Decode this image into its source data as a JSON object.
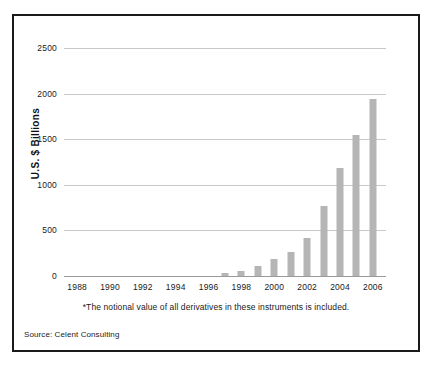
{
  "chart_data": {
    "type": "bar",
    "title": "",
    "xlabel": "",
    "ylabel": "U.S. $ Billions",
    "ylim": [
      0,
      2500
    ],
    "yticks": [
      0,
      500,
      1000,
      1500,
      2000,
      2500
    ],
    "ytick_labels": [
      "0",
      "500",
      "1000",
      "1500",
      "2000",
      "2500"
    ],
    "xlim": [
      1987.2,
      2006.8
    ],
    "xticks": [
      1988,
      1990,
      1992,
      1994,
      1996,
      1998,
      2000,
      2002,
      2004,
      2006
    ],
    "xtick_labels": [
      "1988",
      "1990",
      "1992",
      "1994",
      "1996",
      "1998",
      "2000",
      "2002",
      "2004",
      "2006"
    ],
    "grid": "horizontal",
    "legend": "none",
    "bar_color": "#b5b5b5",
    "categories": [
      1997,
      1998,
      1999,
      2000,
      2001,
      2002,
      2003,
      2004,
      2005,
      2006
    ],
    "values": [
      30,
      50,
      105,
      190,
      260,
      420,
      770,
      1185,
      1550,
      1940
    ],
    "annotations": [
      "*The notional value of all derivatives in these instruments is included."
    ]
  },
  "figure": {
    "footnote": "*The notional value of all derivatives in these instruments is included.",
    "source": "Source: Celent Consulting",
    "border_color": "#1a1a1a",
    "background_color": "#ffffff",
    "gridline_color": "#c9c9c9"
  }
}
